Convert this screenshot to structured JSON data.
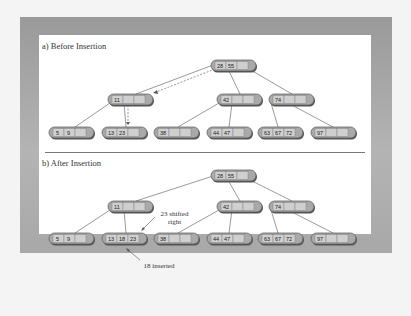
{
  "panels": [
    {
      "title": "a) Before Insertion",
      "nodes": {
        "root": [
          "28",
          "55",
          ""
        ],
        "level1": [
          [
            "11",
            "",
            ""
          ],
          [
            "42",
            "",
            ""
          ],
          [
            "74",
            "",
            ""
          ]
        ],
        "leaves": [
          [
            "5",
            "9",
            ""
          ],
          [
            "13",
            "23",
            ""
          ],
          [
            "38",
            "",
            ""
          ],
          [
            "44",
            "47",
            ""
          ],
          [
            "63",
            "67",
            "72"
          ],
          [
            "97",
            "",
            ""
          ]
        ]
      }
    },
    {
      "title": "b) After Insertion",
      "nodes": {
        "root": [
          "28",
          "55",
          ""
        ],
        "level1": [
          [
            "11",
            "",
            ""
          ],
          [
            "42",
            "",
            ""
          ],
          [
            "74",
            "",
            ""
          ]
        ],
        "leaves": [
          [
            "5",
            "9",
            ""
          ],
          [
            "13",
            "18",
            "23"
          ],
          [
            "38",
            "",
            ""
          ],
          [
            "44",
            "47",
            ""
          ],
          [
            "63",
            "67",
            "72"
          ],
          [
            "97",
            "",
            ""
          ]
        ]
      },
      "annotations": {
        "shifted_line1": "23 shifted",
        "shifted_line2": "right",
        "inserted": "18 inserted"
      }
    }
  ],
  "colors": {
    "node_fill": "#a9a9a9",
    "node_border": "#555555",
    "frame": "#a0a0a0",
    "paper": "#ffffff"
  }
}
